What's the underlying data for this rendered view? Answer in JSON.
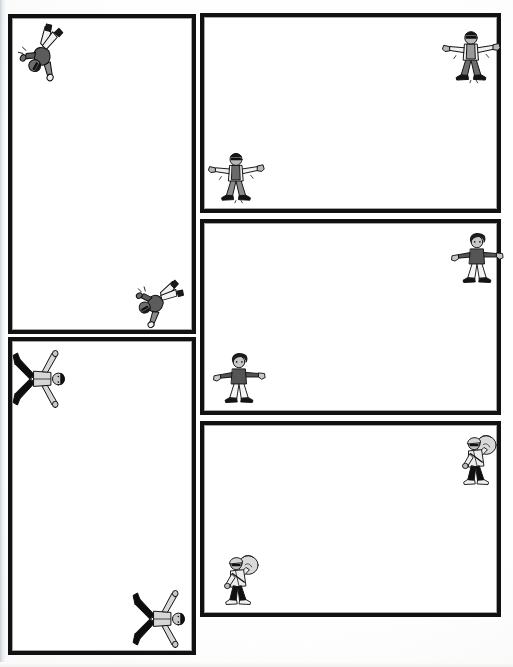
{
  "page": {
    "kind": "comic-page",
    "background_color": "#fefefe",
    "border_color": "#111111",
    "width": 513,
    "height": 667
  },
  "panels": [
    {
      "id": "panel-1",
      "name": "left-column-panel-top",
      "column": "left",
      "order": 1,
      "x": 8,
      "y": 14,
      "w": 188,
      "h": 320,
      "content": ""
    },
    {
      "id": "panel-2",
      "name": "left-column-panel-bottom",
      "column": "left",
      "order": 2,
      "x": 8,
      "y": 337,
      "w": 188,
      "h": 318,
      "content": ""
    },
    {
      "id": "panel-3",
      "name": "right-column-panel-top",
      "column": "right",
      "order": 3,
      "x": 200,
      "y": 13,
      "w": 301,
      "h": 200,
      "content": ""
    },
    {
      "id": "panel-4",
      "name": "right-column-panel-middle",
      "column": "right",
      "order": 4,
      "x": 200,
      "y": 219,
      "w": 301,
      "h": 196,
      "content": ""
    },
    {
      "id": "panel-5",
      "name": "right-column-panel-bottom",
      "column": "right",
      "order": 5,
      "x": 200,
      "y": 421,
      "w": 301,
      "h": 196,
      "content": ""
    }
  ],
  "figures": [
    {
      "id": "figure-1",
      "name": "figure-falling-jacket-top-left",
      "character": "jacket-man",
      "pose": "falling-sideways",
      "rotation_deg": 118,
      "x": 8,
      "y": 18,
      "w": 66,
      "h": 66,
      "colors": {
        "skin": "#6e6e6e",
        "shirt": "#f2f2f2",
        "jacket": "#8a8a8a",
        "pants": "#5c5c5c",
        "shoes": "#1a1a1a"
      }
    },
    {
      "id": "figure-2",
      "name": "figure-falling-jacket-left-lower",
      "character": "jacket-man",
      "pose": "falling-sideways",
      "rotation_deg": 150,
      "x": 126,
      "y": 268,
      "w": 62,
      "h": 62,
      "colors": {
        "skin": "#6e6e6e",
        "shirt": "#f2f2f2",
        "jacket": "#8a8a8a",
        "pants": "#5c5c5c",
        "shoes": "#1a1a1a"
      }
    },
    {
      "id": "figure-3",
      "name": "figure-arms-out-top-right",
      "character": "sunglasses-man",
      "pose": "standing-arms-out",
      "rotation_deg": 0,
      "x": 440,
      "y": 23,
      "w": 62,
      "h": 62,
      "colors": {
        "skin": "#b8b8b8",
        "shirt": "#f0f0f0",
        "vest": "#9a9a9a",
        "pants": "#6d6d6d",
        "shoes": "#141414"
      }
    },
    {
      "id": "figure-4",
      "name": "figure-arms-out-right-panel-top",
      "character": "sunglasses-man",
      "pose": "standing-arms-out",
      "rotation_deg": 0,
      "x": 206,
      "y": 145,
      "w": 60,
      "h": 60,
      "colors": {
        "skin": "#b8b8b8",
        "shirt": "#f0f0f0",
        "vest": "#6a6a6a",
        "pants": "#8c8c8c",
        "shoes": "#141414"
      }
    },
    {
      "id": "figure-5",
      "name": "figure-curly-hair-right-panel-middle-top",
      "character": "curly-hair-person",
      "pose": "standing-arms-out",
      "rotation_deg": 0,
      "x": 448,
      "y": 228,
      "w": 58,
      "h": 58,
      "colors": {
        "skin": "#c7c7c7",
        "hair": "#1c1c1c",
        "top": "#555555",
        "pants": "#f4f4f4",
        "shoes": "#141414"
      }
    },
    {
      "id": "figure-6",
      "name": "figure-curly-hair-right-panel-middle-bottom",
      "character": "curly-hair-person",
      "pose": "standing-arms-out",
      "rotation_deg": 0,
      "x": 210,
      "y": 348,
      "w": 58,
      "h": 58,
      "colors": {
        "skin": "#c7c7c7",
        "hair": "#1c1c1c",
        "top": "#555555",
        "pants": "#f4f4f4",
        "shoes": "#141414"
      }
    },
    {
      "id": "figure-7",
      "name": "figure-sack-carrier-right-panel-bottom-top",
      "character": "sack-carrier",
      "pose": "walking-with-sack",
      "rotation_deg": 0,
      "x": 448,
      "y": 428,
      "w": 58,
      "h": 62,
      "colors": {
        "skin": "#bdbdbd",
        "sack": "#d9d9d9",
        "jacket": "#ededed",
        "pants": "#101010",
        "shoes": "#f0f0f0"
      }
    },
    {
      "id": "figure-8",
      "name": "figure-sack-carrier-right-panel-bottom-bottom",
      "character": "sack-carrier",
      "pose": "walking-with-sack",
      "rotation_deg": 0,
      "x": 210,
      "y": 548,
      "w": 58,
      "h": 62,
      "colors": {
        "skin": "#bdbdbd",
        "sack": "#d9d9d9",
        "jacket": "#ededed",
        "pants": "#101010",
        "shoes": "#f0f0f0"
      }
    },
    {
      "id": "figure-9",
      "name": "figure-spread-eagle-left-panel-lower-top",
      "character": "spread-eagle-person",
      "pose": "lying-spread-rotated",
      "rotation_deg": 90,
      "x": 10,
      "y": 348,
      "w": 62,
      "h": 62,
      "colors": {
        "skin": "#c9c9c9",
        "hair": "#101010",
        "shirt": "#d7d7d7",
        "pants": "#0d0d0d",
        "shoes": "#0d0d0d"
      }
    },
    {
      "id": "figure-10",
      "name": "figure-spread-eagle-left-panel-lower-bottom",
      "character": "spread-eagle-person",
      "pose": "lying-spread-rotated",
      "rotation_deg": 90,
      "x": 130,
      "y": 588,
      "w": 62,
      "h": 62,
      "colors": {
        "skin": "#c9c9c9",
        "hair": "#101010",
        "shirt": "#d7d7d7",
        "pants": "#0d0d0d",
        "shoes": "#0d0d0d"
      }
    }
  ]
}
